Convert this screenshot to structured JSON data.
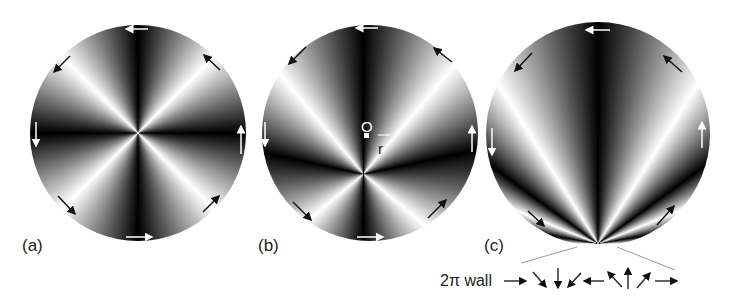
{
  "panels": [
    {
      "id": "a",
      "label": "(a)",
      "description": "vortex centered, four-fold fringe pattern"
    },
    {
      "id": "b",
      "label": "(b)",
      "description": "vortex displaced from center O by r",
      "center_label": "O",
      "offset_label": "r"
    },
    {
      "id": "c",
      "label": "(c)",
      "description": "vortex moved to boundary, forming 2π wall"
    }
  ],
  "wall": {
    "label": "2π wall",
    "arrow_sequence": [
      "→",
      "↘",
      "↓",
      "↙",
      "←",
      "↖",
      "↑",
      "↗",
      "→"
    ]
  },
  "colors": {
    "dark": "#000000",
    "light": "#ffffff",
    "text": "#222222"
  }
}
